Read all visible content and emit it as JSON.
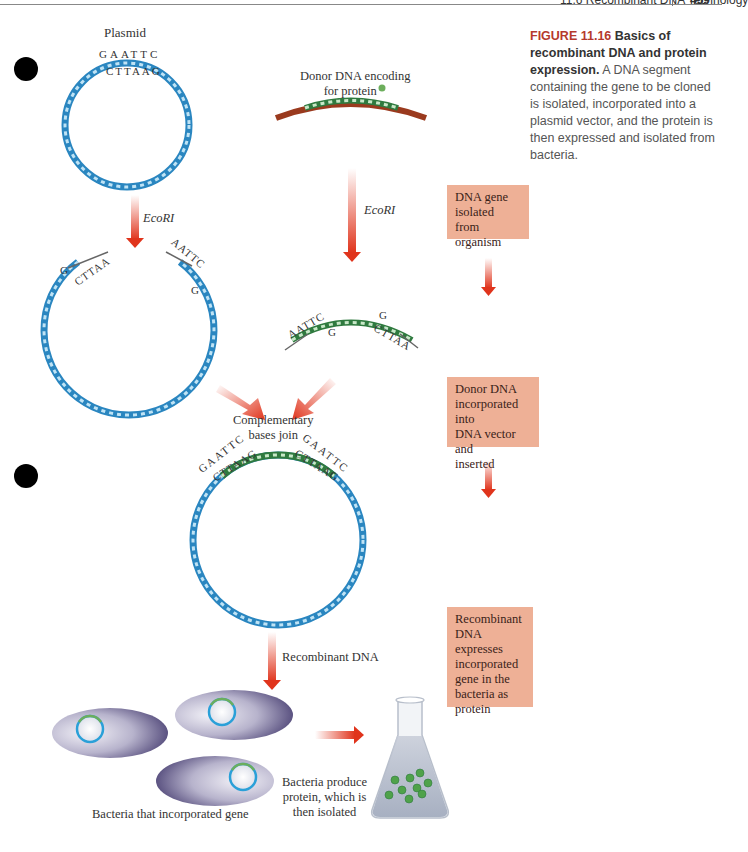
{
  "header": {
    "running_head": "11.6 Recombinant DNA Technology",
    "page_number": "459"
  },
  "caption": {
    "figure_label": "FIGURE 11.16",
    "title": "Basics of recombinant DNA and protein expression.",
    "body": "A DNA segment containing the gene to be cloned is isolated, incorporated into a plasmid vector, and the protein is then expressed and isolated from bacteria."
  },
  "diagram": {
    "plasmid_label": "Plasmid",
    "plasmid_top_strand": "GAATTC",
    "plasmid_bottom_strand": "CTTAAG",
    "donor_label_line1": "Donor DNA encoding",
    "donor_label_line2": "for protein",
    "enzyme_left": "EcoRI",
    "enzyme_right": "EcoRI",
    "cut_plasmid_left_top": "G",
    "cut_plasmid_left_bottom": "CTTAA",
    "cut_plasmid_right_top": "AATTC",
    "cut_plasmid_right_bottom": "G",
    "cut_donor_left_top": "AATTC",
    "cut_donor_left_bottom": "G",
    "cut_donor_right_top": "G",
    "cut_donor_right_bottom": "CTTAA",
    "join_label_line1": "Complementary",
    "join_label_line2": "bases join",
    "recombinant_left_top": "GAATTC",
    "recombinant_left_bottom": "CTTAAG",
    "recombinant_right_top": "GAATTC",
    "recombinant_right_bottom": "CTTAAG",
    "recombinant_arrow_label": "Recombinant DNA",
    "bacteria_label": "Bacteria that incorporated gene",
    "produce_label_line1": "Bacteria produce",
    "produce_label_line2": "protein, which is",
    "produce_label_line3": "then isolated"
  },
  "steps": [
    {
      "line1": "DNA gene",
      "line2": "isolated from",
      "line3": "organism"
    },
    {
      "line1": "Donor DNA",
      "line2": "incorporated into",
      "line3": "DNA vector and",
      "line4": "inserted"
    },
    {
      "line1": "Recombinant",
      "line2": "DNA expresses",
      "line3": "incorporated",
      "line4": "gene in the",
      "line5": "bacteria as",
      "line6": "protein"
    }
  ],
  "colors": {
    "plasmid_blue": "#2a86c0",
    "donor_green": "#2f7a3f",
    "donor_end_red": "#9a3a1e",
    "arrow_red": "#e0341c",
    "step_box": "#eeb096",
    "figure_label": "#b5392c",
    "bacteria_purple": "#4a3f78"
  }
}
